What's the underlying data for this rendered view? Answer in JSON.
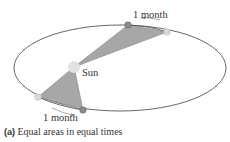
{
  "diagram": {
    "labels": {
      "top_interval": "1 month",
      "bottom_interval": "1 month",
      "sun": "Sun"
    },
    "caption": {
      "tag": "(a)",
      "text": " Equal areas in equal times"
    },
    "colors": {
      "orbit": "#555555",
      "swept_area": "#a7a7a7",
      "sun": "#e2e2e2",
      "planet_dark": "#8a8a8a",
      "planet_light": "#d8d8d8"
    }
  }
}
